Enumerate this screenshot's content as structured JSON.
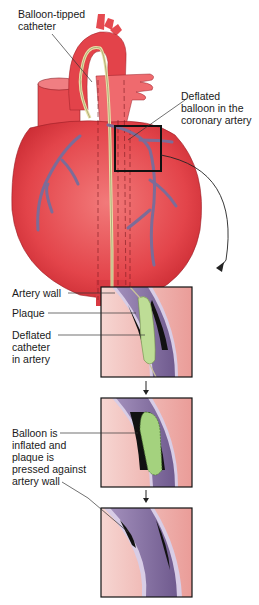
{
  "heart": {
    "label_catheter": "Balloon-tipped\ncatheter",
    "label_balloon": "Deflated\nballoon in the\ncoronary artery"
  },
  "panel1": {
    "label_wall": "Artery wall",
    "label_plaque": "Plaque",
    "label_catheter": "Deflated\ncatheter\nin artery"
  },
  "panel2": {
    "label_inflated": "Balloon is\ninflated and\nplaque is\npressed against\nartery wall"
  },
  "colors": {
    "heart_red": "#e8474c",
    "heart_dark": "#c8242e",
    "vessel_purple": "#8a7aa6",
    "tissue_pink": "#f2c4c0",
    "plaque_green": "#b8d890",
    "balloon_green": "#9fd07c"
  }
}
